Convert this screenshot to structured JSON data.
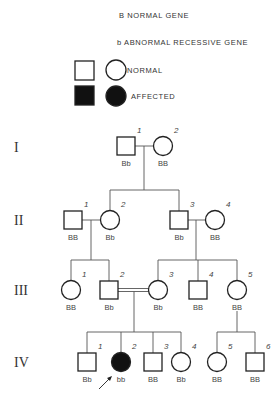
{
  "legend": {
    "normal_gene": "B  NORMAL GENE",
    "abnormal_gene": "b  ABNORMAL RECESSIVE GENE",
    "normal_label": "NORMAL",
    "affected_label": "AFFECTED"
  },
  "generations": [
    {
      "roman": "I",
      "y": 147
    },
    {
      "roman": "II",
      "y": 220
    },
    {
      "roman": "III",
      "y": 290
    },
    {
      "roman": "IV",
      "y": 362
    }
  ],
  "individuals": [
    {
      "id": "I-1",
      "gen": "I",
      "index": "1",
      "sex": "male",
      "affected": false,
      "genotype": "Bb",
      "x": 126,
      "y": 146
    },
    {
      "id": "I-2",
      "gen": "I",
      "index": "2",
      "sex": "female",
      "affected": false,
      "genotype": "BB",
      "x": 163,
      "y": 146
    },
    {
      "id": "II-1",
      "gen": "II",
      "index": "1",
      "sex": "male",
      "affected": false,
      "genotype": "BB",
      "x": 73,
      "y": 220
    },
    {
      "id": "II-2",
      "gen": "II",
      "index": "2",
      "sex": "female",
      "affected": false,
      "genotype": "Bb",
      "x": 110,
      "y": 220
    },
    {
      "id": "II-3",
      "gen": "II",
      "index": "3",
      "sex": "male",
      "affected": false,
      "genotype": "Bb",
      "x": 179,
      "y": 220
    },
    {
      "id": "II-4",
      "gen": "II",
      "index": "4",
      "sex": "female",
      "affected": false,
      "genotype": "BB",
      "x": 215,
      "y": 220
    },
    {
      "id": "III-1",
      "gen": "III",
      "index": "1",
      "sex": "female",
      "affected": false,
      "genotype": "BB",
      "x": 71,
      "y": 290
    },
    {
      "id": "III-2",
      "gen": "III",
      "index": "2",
      "sex": "male",
      "affected": false,
      "genotype": "Bb",
      "x": 109,
      "y": 290
    },
    {
      "id": "III-3",
      "gen": "III",
      "index": "3",
      "sex": "female",
      "affected": false,
      "genotype": "Bb",
      "x": 158,
      "y": 290
    },
    {
      "id": "III-4",
      "gen": "III",
      "index": "4",
      "sex": "male",
      "affected": false,
      "genotype": "BB",
      "x": 198,
      "y": 290
    },
    {
      "id": "III-5",
      "gen": "III",
      "index": "5",
      "sex": "female",
      "affected": false,
      "genotype": "BB",
      "x": 237,
      "y": 290
    },
    {
      "id": "IV-1",
      "gen": "IV",
      "index": "1",
      "sex": "male",
      "affected": false,
      "genotype": "Bb",
      "x": 87,
      "y": 362
    },
    {
      "id": "IV-2",
      "gen": "IV",
      "index": "2",
      "sex": "female",
      "affected": true,
      "genotype": "bb",
      "x": 121,
      "y": 362,
      "proband": true
    },
    {
      "id": "IV-3",
      "gen": "IV",
      "index": "3",
      "sex": "male",
      "affected": false,
      "genotype": "BB",
      "x": 153,
      "y": 362
    },
    {
      "id": "IV-4",
      "gen": "IV",
      "index": "4",
      "sex": "female",
      "affected": false,
      "genotype": "Bb",
      "x": 181,
      "y": 362
    },
    {
      "id": "IV-5",
      "gen": "IV",
      "index": "5",
      "sex": "female",
      "affected": false,
      "genotype": "BB",
      "x": 217,
      "y": 362
    },
    {
      "id": "IV-6",
      "gen": "IV",
      "index": "6",
      "sex": "male",
      "affected": false,
      "genotype": "BB",
      "x": 255,
      "y": 362
    }
  ],
  "matings": [
    {
      "a": "I-1",
      "b": "I-2",
      "consanguineous": false,
      "children": [
        "II-2",
        "II-3"
      ]
    },
    {
      "a": "II-1",
      "b": "II-2",
      "consanguineous": false,
      "children": [
        "III-1",
        "III-2"
      ]
    },
    {
      "a": "II-3",
      "b": "II-4",
      "consanguineous": false,
      "children": [
        "III-3",
        "III-4",
        "III-5"
      ]
    },
    {
      "a": "III-2",
      "b": "III-3",
      "consanguineous": true,
      "children": [
        "IV-1",
        "IV-2",
        "IV-3",
        "IV-4"
      ]
    },
    {
      "a": "III-5",
      "b": null,
      "consanguineous": false,
      "children": [
        "IV-5",
        "IV-6"
      ]
    }
  ],
  "proband_marker": "arrow"
}
